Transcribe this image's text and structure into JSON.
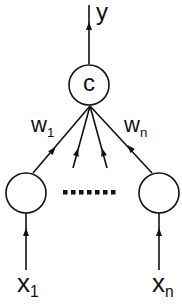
{
  "diagram": {
    "output_label": "y",
    "combiner_node": {
      "label": "c"
    },
    "weights": [
      {
        "base": "w",
        "subscript": "1"
      },
      {
        "base": "w",
        "subscript": "n"
      }
    ],
    "inputs": [
      {
        "base": "x",
        "subscript": "1"
      },
      {
        "base": "x",
        "subscript": "n"
      }
    ],
    "ellipsis": "·······",
    "colors": {
      "stroke": "#111111",
      "background": "#ffffff"
    }
  }
}
